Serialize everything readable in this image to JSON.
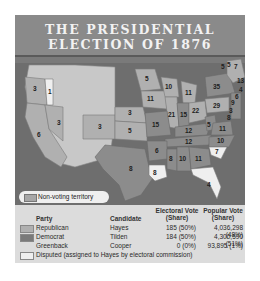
{
  "title": {
    "line1": "THE PRESIDENTIAL",
    "line2": "ELECTION OF 1876"
  },
  "colors": {
    "banner": "#8a8a8a",
    "ocean": "#6e6e6e",
    "republican": "#b0b0b0",
    "democrat": "#8c8c8c",
    "disputed": "#efefef",
    "non_voting": "#c8c8c8",
    "legend_bg": "#dcdcdc"
  },
  "map": {
    "non_voting_label": "Non-voting territory",
    "state_labels": [
      {
        "state": "OR",
        "votes": "3"
      },
      {
        "state": "OR-disputed",
        "votes": "1"
      },
      {
        "state": "NV",
        "votes": "3"
      },
      {
        "state": "CA",
        "votes": "6"
      },
      {
        "state": "CO",
        "votes": "3"
      },
      {
        "state": "NE",
        "votes": "3"
      },
      {
        "state": "KS",
        "votes": "5"
      },
      {
        "state": "MN",
        "votes": "5"
      },
      {
        "state": "IA",
        "votes": "11"
      },
      {
        "state": "WI",
        "votes": "10"
      },
      {
        "state": "MI",
        "votes": "11"
      },
      {
        "state": "IL",
        "votes": "21"
      },
      {
        "state": "IN",
        "votes": "15"
      },
      {
        "state": "OH",
        "votes": "22"
      },
      {
        "state": "MO",
        "votes": "15"
      },
      {
        "state": "KY",
        "votes": "12"
      },
      {
        "state": "TN",
        "votes": "12"
      },
      {
        "state": "AR",
        "votes": "6"
      },
      {
        "state": "TX",
        "votes": "8"
      },
      {
        "state": "LA",
        "votes": "8"
      },
      {
        "state": "MS",
        "votes": "8"
      },
      {
        "state": "AL",
        "votes": "10"
      },
      {
        "state": "GA",
        "votes": "11"
      },
      {
        "state": "FL",
        "votes": "4"
      },
      {
        "state": "SC",
        "votes": "7"
      },
      {
        "state": "NC",
        "votes": "10"
      },
      {
        "state": "VA",
        "votes": "11"
      },
      {
        "state": "WV",
        "votes": "5"
      },
      {
        "state": "PA",
        "votes": "29"
      },
      {
        "state": "NY",
        "votes": "35"
      },
      {
        "state": "VT",
        "votes": "5"
      },
      {
        "state": "NH",
        "votes": "5"
      },
      {
        "state": "ME",
        "votes": "7"
      },
      {
        "state": "MA",
        "votes": "13"
      },
      {
        "state": "RI",
        "votes": "4"
      },
      {
        "state": "CT",
        "votes": "6"
      },
      {
        "state": "NJ",
        "votes": "9"
      },
      {
        "state": "DE",
        "votes": "3"
      },
      {
        "state": "MD",
        "votes": "8"
      }
    ]
  },
  "legend": {
    "headers": {
      "party": "Party",
      "candidate": "Candidate",
      "electoral_vote": "Electoral Vote",
      "electoral_vote_sub": "(Share)",
      "popular_vote": "Popular Vote",
      "popular_vote_sub": "(Share)"
    },
    "rows": [
      {
        "party": "Republican",
        "candidate": "Hayes",
        "electoral": "185 (50%)",
        "popular": "4,036,298 (48%)"
      },
      {
        "party": "Democrat",
        "candidate": "Tilden",
        "electoral": "184 (50%)",
        "popular": "4,300,590 (51%)"
      },
      {
        "party": "Greenback",
        "candidate": "Cooper",
        "electoral": "0 (0%)",
        "popular": "93,895 (1%)"
      }
    ],
    "disputed": "Disputed (assigned to Hayes by electoral commission)"
  }
}
